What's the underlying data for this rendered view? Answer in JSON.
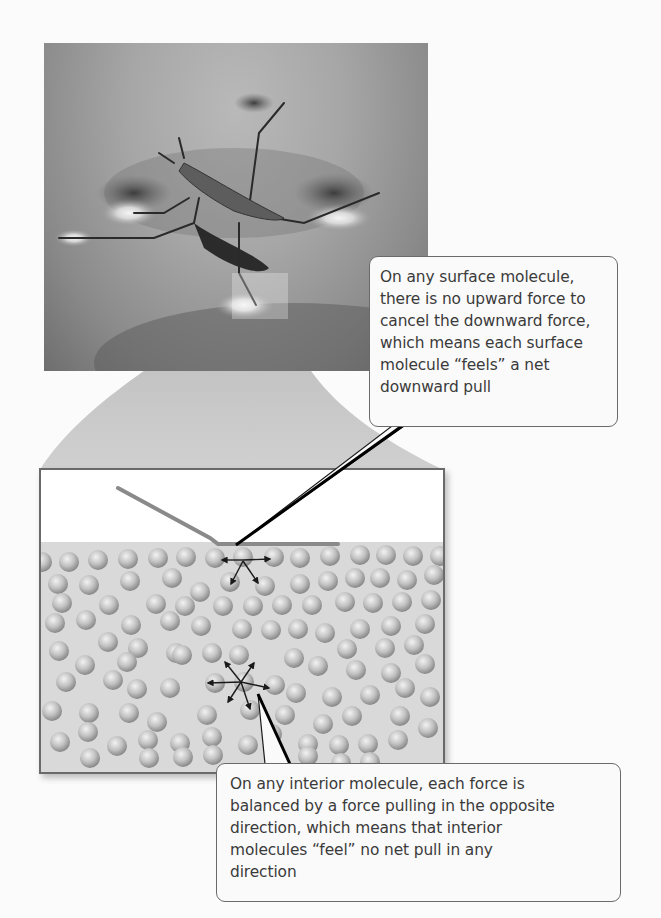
{
  "figure": {
    "photo": {
      "description": "Water strider insect on water surface with dimples under its legs",
      "inset_square_label": "zoom region"
    },
    "molecule_diagram": {
      "description": "Cross-section of water molecules with insect leg resting on surface",
      "surface_molecule_arrows": [
        "left",
        "right",
        "down-left",
        "down-right"
      ],
      "interior_molecule_arrows": [
        "left",
        "right",
        "up-left",
        "up-right",
        "down-left",
        "down-right"
      ]
    },
    "callouts": {
      "surface": {
        "lines": [
          "On any surface molecule,",
          "there is no upward force to",
          "cancel the downward force,",
          "which means each surface",
          "molecule “feels” a net",
          "downward pull"
        ]
      },
      "interior": {
        "lines": [
          "On any interior molecule, each force is",
          "balanced by a force pulling in the opposite",
          "direction, which means that interior",
          "molecules “feel” no net pull in any",
          "direction"
        ]
      }
    },
    "colors": {
      "background": "#fbfbfb",
      "photo_mid": "#9a9a9a",
      "fan": "#c4c4c4",
      "water": "#d6d6d6",
      "molecule": "#b8b8b8",
      "box_border": "#6a6a6a",
      "callout_text": "#3a3a3a",
      "arrow": "#1a1a1a"
    }
  }
}
